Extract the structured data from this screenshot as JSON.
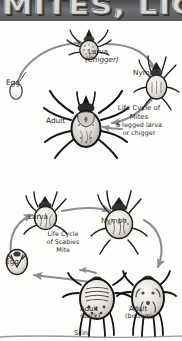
{
  "banner": {
    "title": "MITES, LICE"
  },
  "upper_cycle": {
    "caption_line1": "Life Cycle of",
    "caption_line2": "Mites",
    "caption_line3": "6 legged larva",
    "caption_line4": "or chigger",
    "labels": {
      "egg": "Egg",
      "larva": "Larva",
      "larva_sub": "(Chigger)",
      "nymph": "Nymph",
      "adult": "Adult"
    }
  },
  "lower_cycle": {
    "caption_line1": "Life Cycle",
    "caption_line2": "of Scabies",
    "caption_line3": "Mite",
    "labels": {
      "egg": "Egg",
      "larva": "Larva",
      "nymph": "Nymph",
      "adult_back": "Adult",
      "adult_back_sub": "(back)",
      "adult_bottom": "Adult",
      "adult_bottom_sub": "(bottom)",
      "skin": "Skin"
    }
  },
  "colors": {
    "banner_bg": "#5a5a5a",
    "banner_text": "#d9d9d9",
    "ink": "#2a2a2a",
    "arrow": "#8d8d8d",
    "paper": "#fdfdfc"
  }
}
